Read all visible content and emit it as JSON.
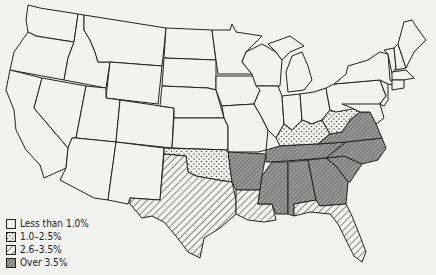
{
  "map": {
    "title": "",
    "categories": [
      {
        "key": "c1",
        "label": "Less than 1.0%",
        "pattern": "blank"
      },
      {
        "key": "c2",
        "label": "1.0–2.5%",
        "pattern": "dots"
      },
      {
        "key": "c3",
        "label": "2.6–3.5%",
        "pattern": "light-hatch"
      },
      {
        "key": "c4",
        "label": "Over 3.5%",
        "pattern": "dark-hatch"
      }
    ],
    "states": {
      "c2": [
        "Oklahoma",
        "Kentucky",
        "West Virginia"
      ],
      "c3": [
        "Texas",
        "Louisiana",
        "Florida"
      ],
      "c4": [
        "Arkansas",
        "Tennessee",
        "Mississippi",
        "Alabama",
        "Georgia",
        "South Carolina",
        "North Carolina",
        "Virginia"
      ]
    }
  },
  "legend": {
    "items": [
      "Less than 1.0%",
      "1.0–2.5%",
      "2.6–3.5%",
      "Over 3.5%"
    ]
  }
}
